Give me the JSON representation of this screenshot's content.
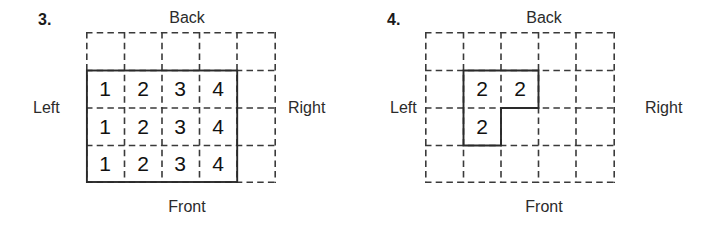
{
  "page": {
    "background_color": "#ffffff",
    "line_color": "#333333",
    "text_color": "#1a1a1a"
  },
  "problems": [
    {
      "number_label": "3.",
      "labels": {
        "back": "Back",
        "front": "Front",
        "left": "Left",
        "right": "Right"
      },
      "grid": {
        "columns": 5,
        "rows": 4,
        "cell_size_px": 38,
        "dashed": true
      },
      "filled_cells": [
        {
          "row": 1,
          "col": 0,
          "value": "1"
        },
        {
          "row": 1,
          "col": 1,
          "value": "2"
        },
        {
          "row": 1,
          "col": 2,
          "value": "3"
        },
        {
          "row": 1,
          "col": 3,
          "value": "4"
        },
        {
          "row": 2,
          "col": 0,
          "value": "1"
        },
        {
          "row": 2,
          "col": 1,
          "value": "2"
        },
        {
          "row": 2,
          "col": 2,
          "value": "3"
        },
        {
          "row": 2,
          "col": 3,
          "value": "4"
        },
        {
          "row": 3,
          "col": 0,
          "value": "1"
        },
        {
          "row": 3,
          "col": 1,
          "value": "2"
        },
        {
          "row": 3,
          "col": 2,
          "value": "3"
        },
        {
          "row": 3,
          "col": 3,
          "value": "4"
        }
      ],
      "outline_shape": "rectangle rows 2-4, cols 1-4"
    },
    {
      "number_label": "4.",
      "labels": {
        "back": "Back",
        "front": "Front",
        "left": "Left",
        "right": "Right"
      },
      "grid": {
        "columns": 5,
        "rows": 4,
        "cell_size_px": 38,
        "dashed": true
      },
      "filled_cells": [
        {
          "row": 1,
          "col": 1,
          "value": "2"
        },
        {
          "row": 1,
          "col": 2,
          "value": "2"
        },
        {
          "row": 2,
          "col": 1,
          "value": "2"
        }
      ],
      "outline_shape": "L-shape: row 2 cols 2-3, row 3 col 2"
    }
  ]
}
